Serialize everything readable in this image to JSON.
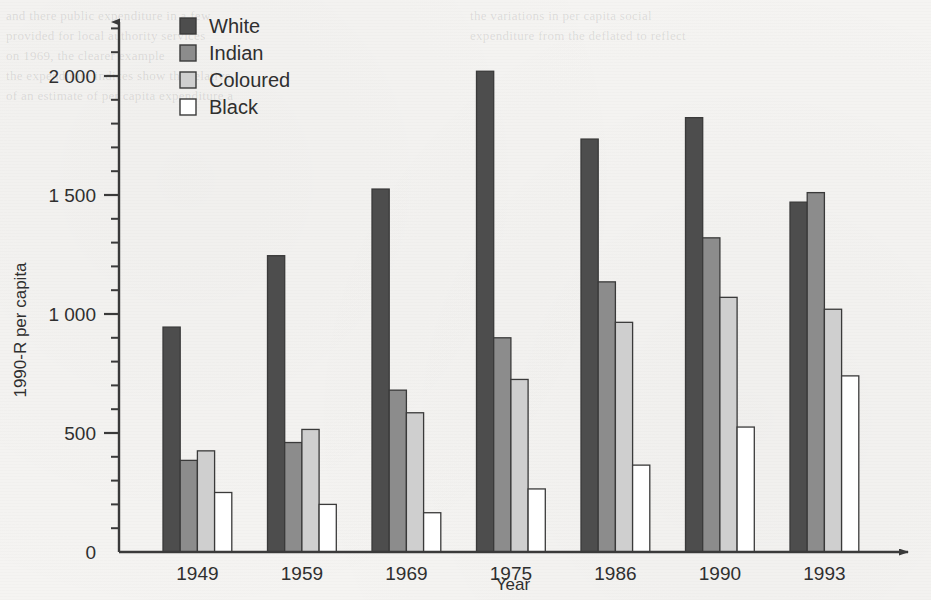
{
  "chart_data": {
    "type": "bar",
    "title": "",
    "xlabel": "Year",
    "ylabel": "1990-R per capita",
    "categories": [
      "1949",
      "1959",
      "1969",
      "1975",
      "1986",
      "1990",
      "1993"
    ],
    "series": [
      {
        "name": "White",
        "color": "#4d4d4d",
        "values": [
          945,
          1245,
          1525,
          2020,
          1735,
          1825,
          1470
        ]
      },
      {
        "name": "Indian",
        "color": "#8c8c8c",
        "values": [
          385,
          460,
          680,
          900,
          1135,
          1320,
          1510
        ]
      },
      {
        "name": "Coloured",
        "color": "#cfcfcf",
        "values": [
          425,
          515,
          585,
          725,
          965,
          1070,
          1020
        ]
      },
      {
        "name": "Black",
        "color": "#ffffff",
        "values": [
          250,
          200,
          165,
          265,
          365,
          525,
          740
        ]
      }
    ],
    "ylim": [
      0,
      2200
    ],
    "y_ticks_major": [
      0,
      500,
      1000,
      1500,
      2000
    ],
    "y_tick_labels": [
      "0",
      "500",
      "1 000",
      "1 500",
      "2 000"
    ],
    "y_tick_minor_step": 100,
    "grid": false,
    "legend_position": "top-left-inside",
    "axis_color": "#3a3a3a",
    "background_color": "#f5f4f2"
  },
  "legend": {
    "entries": [
      {
        "label": "White"
      },
      {
        "label": "Indian"
      },
      {
        "label": "Coloured"
      },
      {
        "label": "Black"
      }
    ]
  },
  "ghost_text": {
    "lines": [
      "and there public expenditure in a few",
      "provided for local authority services",
      "on 1969, the clearer example",
      "the expenditure indices show the relative",
      "of an estimate of per capita expenditure a",
      "the variations in per capita social",
      "expenditure from the deflated to reflect"
    ]
  }
}
